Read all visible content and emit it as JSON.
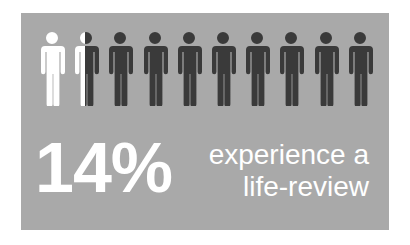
{
  "infographic": {
    "stat_value": "14%",
    "caption_line1": "experience a",
    "caption_line2": "life-review",
    "total_figures": 10,
    "filled_fraction": 0.14,
    "colors": {
      "panel_background": "#a9a9a9",
      "highlight_figure": "#ffffff",
      "base_figure": "#3a3a3a",
      "text": "#ffffff"
    },
    "icons": {
      "figure_icon": "person-icon"
    }
  }
}
